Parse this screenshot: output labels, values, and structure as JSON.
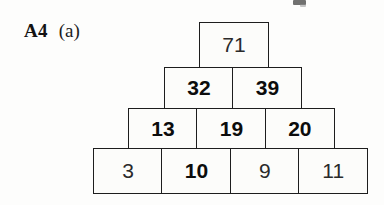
{
  "label": {
    "code": "A4",
    "part": "(a)"
  },
  "colors": {
    "page_background": "#fdfdfc",
    "cell_background": "#fcfcfa",
    "border": "#1d1d1d",
    "text_bold": "#0c0c0c",
    "text_regular": "#2a2a2a"
  },
  "pyramid": {
    "description": "number pyramid, 4 rows, each cell is the sum of the two cells below it",
    "rows": [
      {
        "index": 1,
        "cells": [
          {
            "value": "71",
            "emphasis": "regular"
          }
        ]
      },
      {
        "index": 2,
        "cells": [
          {
            "value": "32",
            "emphasis": "bold"
          },
          {
            "value": "39",
            "emphasis": "bold"
          }
        ]
      },
      {
        "index": 3,
        "cells": [
          {
            "value": "13",
            "emphasis": "bold"
          },
          {
            "value": "19",
            "emphasis": "bold"
          },
          {
            "value": "20",
            "emphasis": "bold"
          }
        ]
      },
      {
        "index": 4,
        "cells": [
          {
            "value": "3",
            "emphasis": "regular"
          },
          {
            "value": "10",
            "emphasis": "bold"
          },
          {
            "value": "9",
            "emphasis": "regular"
          },
          {
            "value": "11",
            "emphasis": "regular"
          }
        ]
      }
    ]
  }
}
